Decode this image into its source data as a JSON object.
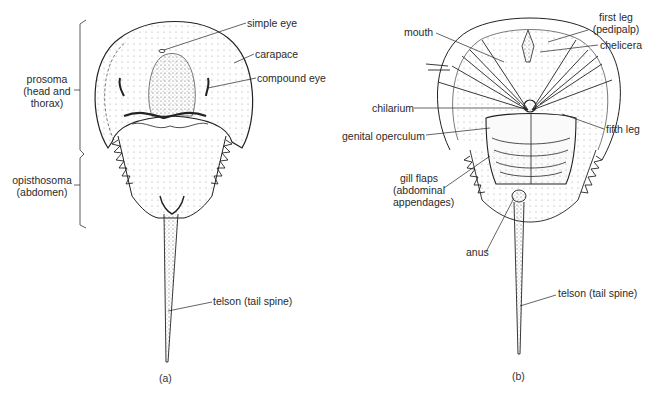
{
  "figure": {
    "panels": [
      {
        "id": "a",
        "caption": "(a)",
        "view": "dorsal",
        "labels": {
          "simple_eye": "simple eye",
          "carapace": "carapace",
          "compound_eye": "compound eye",
          "prosoma_1": "prosoma",
          "prosoma_2": "(head and",
          "prosoma_3": "thorax)",
          "opisthosoma_1": "opisthosoma",
          "opisthosoma_2": "(abdomen)",
          "telson": "telson (tail spine)"
        }
      },
      {
        "id": "b",
        "caption": "(b)",
        "view": "ventral",
        "labels": {
          "mouth": "mouth",
          "first_leg_1": "first leg",
          "first_leg_2": "(pedipalp)",
          "chelicera": "chelicera",
          "chilarium": "chilarium",
          "fifth_leg": "fifth leg",
          "genital_operculum": "genital operculum",
          "gill_flaps_1": "gill flaps",
          "gill_flaps_2": "(abdominal",
          "gill_flaps_3": "appendages)",
          "anus": "anus",
          "telson": "telson (tail spine)"
        }
      }
    ]
  }
}
